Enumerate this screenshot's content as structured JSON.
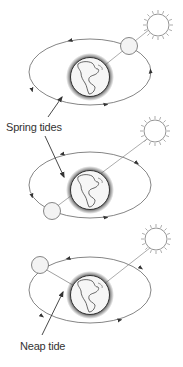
{
  "labels": {
    "spring": "Spring tides",
    "neap": "Neap tide"
  },
  "colors": {
    "line": "#555555",
    "body_fill": "#f4f4f4",
    "shadow": "#666666"
  },
  "diagrams": [
    {
      "name": "spring-tide-full-moon",
      "orbit_center": [
        90,
        72
      ],
      "earth": [
        90,
        77
      ],
      "moon": [
        135,
        49
      ],
      "sun": [
        155,
        25
      ]
    },
    {
      "name": "spring-tide-new-moon",
      "orbit_center": [
        90,
        185
      ],
      "earth": [
        90,
        190
      ],
      "moon": [
        50,
        209
      ],
      "sun": [
        155,
        133
      ]
    },
    {
      "name": "neap-tide-quarter-moon",
      "orbit_center": [
        90,
        290
      ],
      "earth": [
        90,
        295
      ],
      "moon": [
        38,
        265
      ],
      "sun": [
        155,
        245
      ]
    }
  ]
}
